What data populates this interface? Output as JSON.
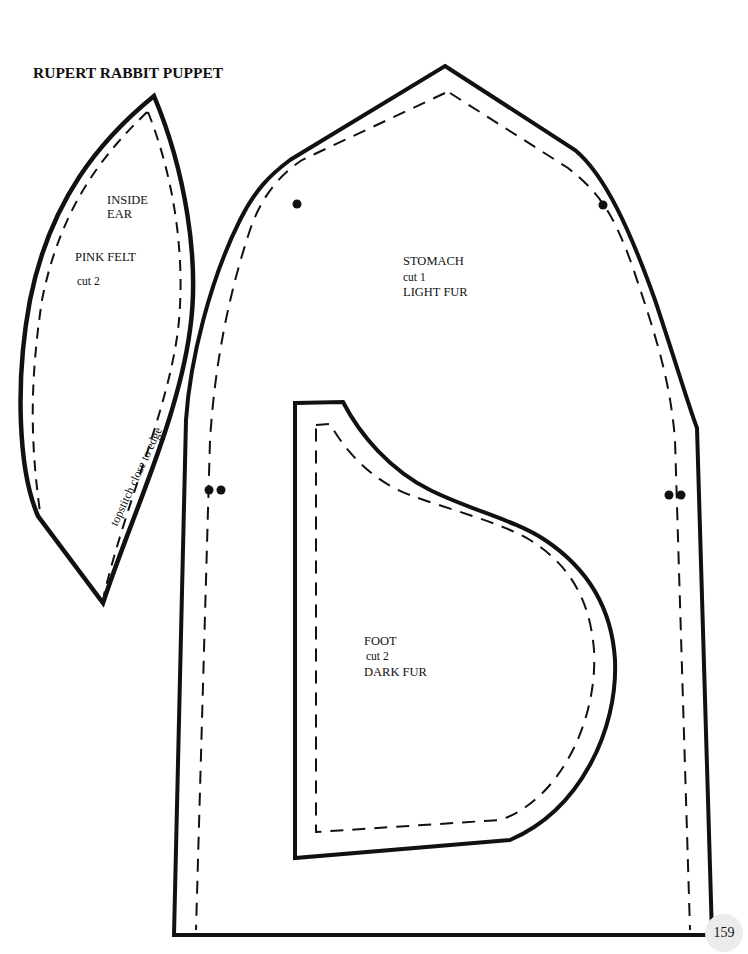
{
  "page": {
    "title": "RUPERT RABBIT PUPPET",
    "page_number": "159",
    "ink_color": "#111111",
    "paper_color": "#ffffff"
  },
  "pieces": {
    "inside_ear": {
      "name_line1": "INSIDE",
      "name_line2": "EAR",
      "material": "PINK FELT",
      "cut": "cut 2",
      "note": "topstitch close to edge"
    },
    "stomach": {
      "name": "STOMACH",
      "cut": "cut 1",
      "material": "LIGHT FUR"
    },
    "foot": {
      "name": "FOOT",
      "cut": "cut 2",
      "material": "DARK FUR"
    }
  },
  "legend": {
    "solid_line": "cutting-line",
    "dashed_line": "stitching-line",
    "dot": "matching-mark"
  }
}
